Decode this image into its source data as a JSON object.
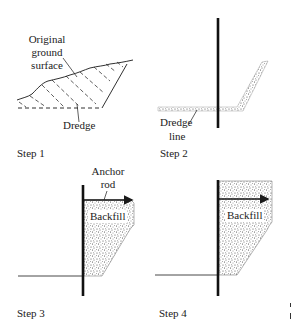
{
  "figure": {
    "panels": [
      {
        "id": "step1",
        "caption": "Step 1",
        "labels": {
          "ground": [
            "Original",
            "ground",
            "surface"
          ],
          "dredge": "Dredge"
        }
      },
      {
        "id": "step2",
        "caption": "Step 2",
        "labels": {
          "dredge_line": [
            "Dredge",
            "line"
          ]
        }
      },
      {
        "id": "step3",
        "caption": "Step 3",
        "labels": {
          "anchor_rod": [
            "Anchor",
            "rod"
          ],
          "backfill": "Backfill"
        }
      },
      {
        "id": "step4",
        "caption": "Step 4",
        "labels": {
          "backfill": "Backfill"
        }
      }
    ],
    "colors": {
      "line": "#1a1a1a",
      "fill_stipple": "#555555",
      "background": "#ffffff"
    }
  }
}
